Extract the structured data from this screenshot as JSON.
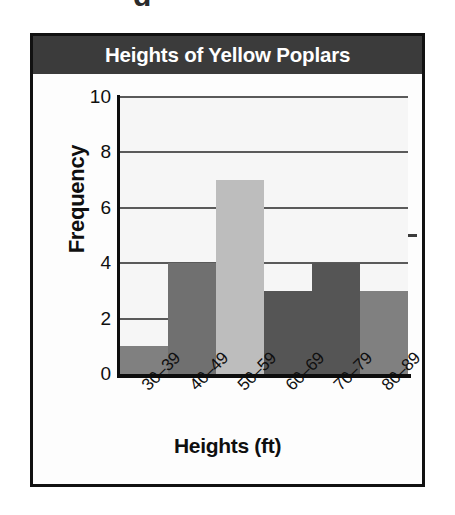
{
  "figure": {
    "title": "Heights of Yellow Poplars",
    "top_artifact_glyph": "g"
  },
  "colors": {
    "title_banner_bg": "#3b3b3b",
    "title_text": "#ffffff",
    "frame_border": "#111111",
    "plot_bg": "#f6f6f6",
    "gridline": "#5a5a5a",
    "axis": "#0d0d0d",
    "bar_medium_gray": "#808080",
    "bar_medium_dark_gray": "#707070",
    "bar_light_gray": "#bdbdbd",
    "bar_dark_gray": "#555555"
  },
  "chart_data": {
    "type": "bar",
    "title": "Heights of Yellow Poplars",
    "xlabel": "Heights (ft)",
    "ylabel": "Frequency",
    "categories": [
      "30–39",
      "40–49",
      "50–59",
      "60–69",
      "70–79",
      "80–89"
    ],
    "values": [
      1,
      4,
      7,
      3,
      4,
      3
    ],
    "bar_colors": [
      "#808080",
      "#707070",
      "#bdbdbd",
      "#555555",
      "#555555",
      "#808080"
    ],
    "ylim": [
      0,
      10
    ],
    "ytick_labels": [
      "0",
      "2",
      "4",
      "6",
      "8",
      "10"
    ],
    "ytick_values": [
      0,
      2,
      4,
      6,
      8,
      10
    ],
    "grid": "horizontal",
    "legend": "none",
    "bars_contiguous": true,
    "xtick_label_rotation_deg": -45
  }
}
